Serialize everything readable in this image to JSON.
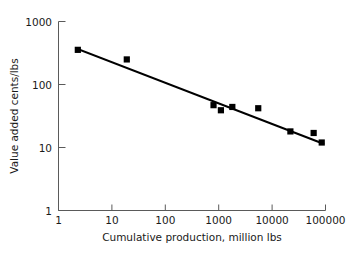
{
  "chart_data": {
    "type": "scatter",
    "title": "",
    "xlabel": "Cumulative production, million lbs",
    "ylabel": "Value added cents/lbs",
    "xscale": "log",
    "yscale": "log",
    "xlim": [
      1,
      100000
    ],
    "ylim": [
      1,
      1000
    ],
    "grid": false,
    "legend": "none",
    "xticks": [
      1,
      10,
      100,
      1000,
      10000,
      100000
    ],
    "xtick_labels": [
      "1",
      "10",
      "100",
      "1000",
      "10000",
      "100000"
    ],
    "yticks": [
      1,
      10,
      100,
      1000
    ],
    "ytick_labels": [
      "1",
      "10",
      "100",
      "1000"
    ],
    "points": [
      {
        "x": 2.3,
        "y": 355
      },
      {
        "x": 19,
        "y": 250
      },
      {
        "x": 800,
        "y": 47
      },
      {
        "x": 1100,
        "y": 39
      },
      {
        "x": 1800,
        "y": 44
      },
      {
        "x": 5500,
        "y": 42
      },
      {
        "x": 22000,
        "y": 18
      },
      {
        "x": 60000,
        "y": 17
      },
      {
        "x": 85000,
        "y": 12
      }
    ],
    "trend_line": {
      "name": "fitted experience curve",
      "x_start": 2.4,
      "y_start": 360,
      "x_end": 90000,
      "y_end": 11.5
    }
  },
  "axes": {
    "x_title": "Cumulative production, million lbs",
    "y_title": "Value added cents/lbs",
    "x_tick_1": "1",
    "x_tick_2": "10",
    "x_tick_3": "100",
    "x_tick_4": "1000",
    "x_tick_5": "10000",
    "x_tick_6": "100000",
    "y_tick_1": "1",
    "y_tick_2": "10",
    "y_tick_3": "100",
    "y_tick_4": "1000"
  },
  "colors": {
    "marker": "#000000",
    "line": "#000000",
    "axis": "#5a5a5a",
    "background": "#ffffff",
    "text": "#1a1a1a"
  }
}
